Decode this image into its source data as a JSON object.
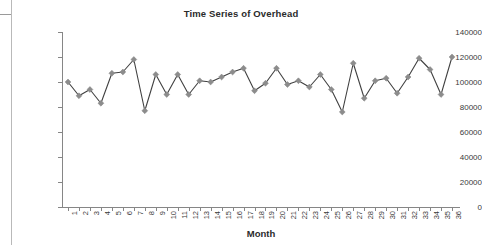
{
  "chart_data": {
    "type": "line",
    "title": "Time Series of Overhead",
    "xlabel": "Month",
    "ylabel": "",
    "xlim": [
      1,
      36
    ],
    "ylim": [
      0,
      140000
    ],
    "ytick_labels": [
      "140000",
      "120000",
      "100000",
      "80000",
      "60000",
      "40000",
      "20000",
      "0"
    ],
    "ytick_values": [
      140000,
      120000,
      100000,
      80000,
      60000,
      40000,
      20000,
      0
    ],
    "ytick_step": 20000,
    "grid": false,
    "legend": false,
    "marker": "diamond",
    "marker_color": "#8c8c8c",
    "line_color": "#404040",
    "categories": [
      "1",
      "2",
      "3",
      "4",
      "5",
      "6",
      "7",
      "8",
      "9",
      "10",
      "11",
      "12",
      "13",
      "14",
      "15",
      "16",
      "17",
      "18",
      "19",
      "20",
      "21",
      "22",
      "23",
      "24",
      "25",
      "26",
      "27",
      "28",
      "29",
      "30",
      "31",
      "32",
      "33",
      "34",
      "35",
      "36"
    ],
    "values": [
      100000,
      89000,
      94000,
      83000,
      107000,
      108000,
      118000,
      77000,
      106000,
      90000,
      106000,
      90000,
      101000,
      100000,
      104000,
      108000,
      111000,
      93000,
      99000,
      111000,
      98000,
      101000,
      96000,
      106000,
      94000,
      76000,
      115000,
      87000,
      101000,
      103000,
      91000,
      104000,
      119000,
      110000,
      90000,
      120000
    ],
    "series_name": "Overhead"
  },
  "chart": {
    "title": "Time Series of Overhead",
    "xlabel": "Month"
  }
}
